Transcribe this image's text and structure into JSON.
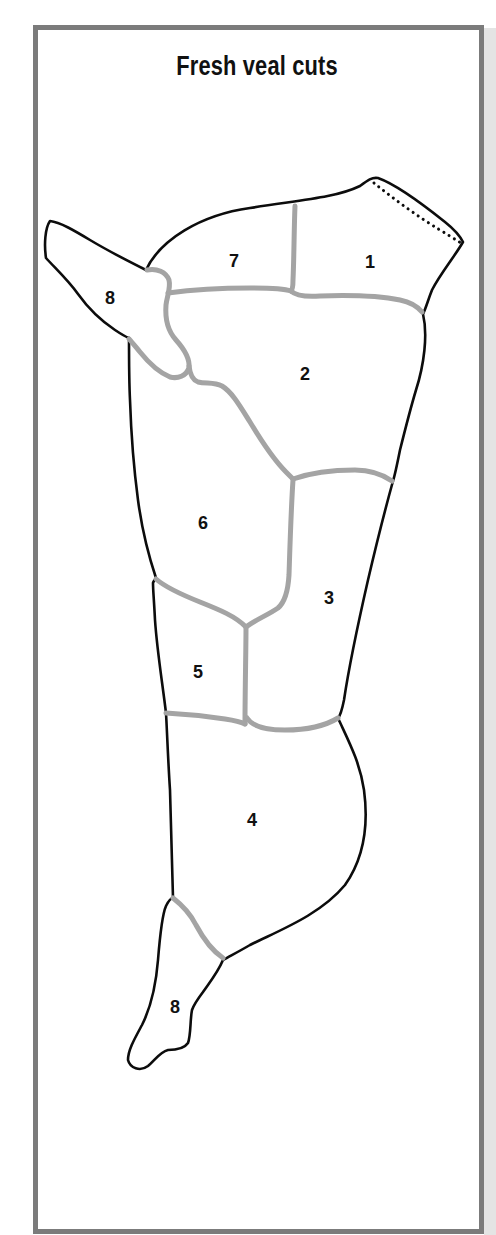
{
  "title": "Fresh veal cuts",
  "colors": {
    "frame_border": "#7b7b7b",
    "outline": "#0c0c0c",
    "divider": "#a4a4a4",
    "background": "#ffffff",
    "side_shadow": "#e4e4e4"
  },
  "diagram": {
    "cuts": [
      {
        "id": "cut-1",
        "label": "1",
        "x": 370,
        "y": 268
      },
      {
        "id": "cut-7",
        "label": "7",
        "x": 234,
        "y": 267
      },
      {
        "id": "cut-8-top",
        "label": "8",
        "x": 110,
        "y": 304
      },
      {
        "id": "cut-2",
        "label": "2",
        "x": 305,
        "y": 380
      },
      {
        "id": "cut-6",
        "label": "6",
        "x": 203,
        "y": 529
      },
      {
        "id": "cut-3",
        "label": "3",
        "x": 329,
        "y": 604
      },
      {
        "id": "cut-5",
        "label": "5",
        "x": 198,
        "y": 678
      },
      {
        "id": "cut-4",
        "label": "4",
        "x": 252,
        "y": 826
      },
      {
        "id": "cut-8-bottom",
        "label": "8",
        "x": 175,
        "y": 1013
      }
    ]
  }
}
